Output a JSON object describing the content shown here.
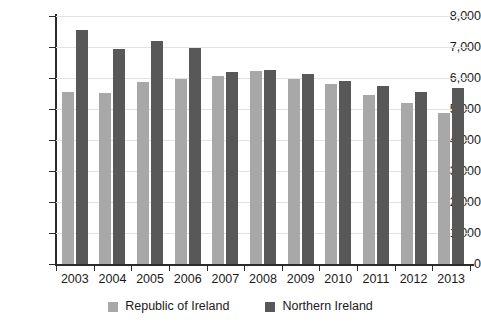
{
  "chart_data": {
    "type": "bar",
    "title": "",
    "subtitle": "",
    "xlabel": "",
    "ylabel": "",
    "grid": true,
    "legend_position": "bottom",
    "ylim": [
      0,
      8000
    ],
    "ytick_values": [
      8000,
      7000,
      6000,
      5000,
      4000,
      3000,
      2000,
      1000,
      0
    ],
    "ytick_labels": [
      "8,000",
      "7,000",
      "6,000",
      "5,000",
      "4,000",
      "3,000",
      "2,000",
      "1,000",
      "0"
    ],
    "categories": [
      "2003",
      "2004",
      "2005",
      "2006",
      "2007",
      "2008",
      "2009",
      "2010",
      "2011",
      "2012",
      "2013"
    ],
    "series": [
      {
        "name": "Republic of Ireland",
        "color": "#a8a8a8",
        "values": [
          5550,
          5530,
          5880,
          5960,
          6050,
          6230,
          5980,
          5800,
          5450,
          5200,
          4870
        ]
      },
      {
        "name": "Northern Ireland",
        "color": "#585858",
        "values": [
          7550,
          6930,
          7200,
          6980,
          6180,
          6250,
          6130,
          5900,
          5740,
          5540,
          5670
        ]
      }
    ]
  },
  "legend": {
    "items": [
      {
        "label": "Republic of Ireland",
        "color": "#a8a8a8",
        "swatch_name": "legend-swatch-republic-of-ireland"
      },
      {
        "label": "Northern Ireland",
        "color": "#585858",
        "swatch_name": "legend-swatch-northern-ireland"
      }
    ]
  }
}
